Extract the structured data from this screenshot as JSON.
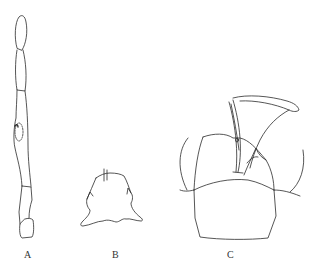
{
  "figure": {
    "type": "scientific line illustration",
    "stroke_color": "#2b2b2b",
    "background": "#ffffff",
    "panels": [
      {
        "id": "A",
        "label": "A",
        "subject": "segmented antenna with oval sensory area"
      },
      {
        "id": "B",
        "label": "B",
        "subject": "head capsule with median seta"
      },
      {
        "id": "C",
        "label": "C",
        "subject": "terminal segments with paired hooked processes and appendage"
      }
    ]
  }
}
